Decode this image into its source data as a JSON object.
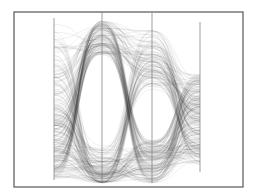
{
  "chart_data": {
    "type": "parallel-coordinates",
    "title": "",
    "xlabel": "",
    "ylabel": "",
    "grid": false,
    "legend": null,
    "frame": {
      "x0": 14,
      "y0": 12,
      "x1": 243,
      "y1": 187
    },
    "axes": [
      {
        "name": "axis-1",
        "x": 54,
        "top": 18,
        "bottom": 180
      },
      {
        "name": "axis-2",
        "x": 102,
        "top": 12,
        "bottom": 183
      },
      {
        "name": "axis-3",
        "x": 152,
        "top": 13,
        "bottom": 183
      },
      {
        "name": "axis-4",
        "x": 200,
        "top": 22,
        "bottom": 172
      }
    ],
    "line_count": 260,
    "line_color": "#3a3a3a",
    "line_opacity": 0.22
  }
}
